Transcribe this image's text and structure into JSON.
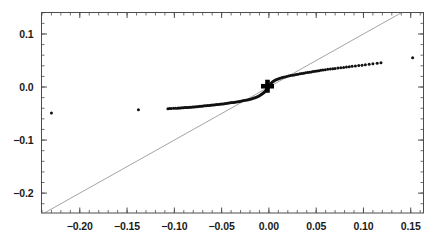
{
  "chart_data": {
    "type": "scatter",
    "title": "",
    "subtitle": "",
    "xlabel": "",
    "ylabel": "",
    "xlim": [
      -0.2405,
      0.1635
    ],
    "ylim": [
      -0.2375,
      0.1405
    ],
    "grid": false,
    "legend": null,
    "xticks": [
      -0.2,
      -0.15,
      -0.1,
      -0.05,
      0.0,
      0.05,
      0.1,
      0.15
    ],
    "xtick_labels": [
      "-0.20",
      "-0.15",
      "-0.10",
      "-0.05",
      "0.00",
      "0.05",
      "0.10",
      "0.15"
    ],
    "yticks": [
      0.1,
      0.0,
      -0.1,
      -0.2
    ],
    "ytick_labels": [
      "0.1",
      "0.0",
      "-0.1",
      "-0.2"
    ],
    "xminor_step": 0.01,
    "yminor_step": 0.02,
    "ticks_inward": true,
    "frame": true,
    "marker": "filled-circle",
    "marker_size": 3.0,
    "marker_color": "#111111",
    "reference_line": {
      "name": "identity-line",
      "type": "line",
      "slope": 1.0,
      "intercept": 0.0,
      "color": "#666666",
      "width": 0.6,
      "x_from": -0.2405,
      "x_to": 0.1405
    },
    "highlight_marker": {
      "name": "origin-plus-marker",
      "symbol": "plus",
      "x": -0.0015,
      "y": 0.0015,
      "size": 13,
      "thickness": 4.6,
      "color": "#000000"
    },
    "series": [
      {
        "name": "quantiles",
        "color": "#111111",
        "points": [
          [
            -0.23,
            -0.049
          ],
          [
            -0.138,
            -0.0428
          ],
          [
            -0.1068,
            -0.0408
          ],
          [
            -0.105,
            -0.0406
          ],
          [
            -0.1032,
            -0.0404
          ],
          [
            -0.1008,
            -0.0402
          ],
          [
            -0.0988,
            -0.04
          ],
          [
            -0.0968,
            -0.0398
          ],
          [
            -0.0952,
            -0.0396
          ],
          [
            -0.0936,
            -0.0394
          ],
          [
            -0.092,
            -0.0392
          ],
          [
            -0.0904,
            -0.039
          ],
          [
            -0.0888,
            -0.0388
          ],
          [
            -0.0872,
            -0.0386
          ],
          [
            -0.0856,
            -0.0384
          ],
          [
            -0.084,
            -0.0382
          ],
          [
            -0.0824,
            -0.038
          ],
          [
            -0.0808,
            -0.0378
          ],
          [
            -0.0792,
            -0.0376
          ],
          [
            -0.0776,
            -0.0373
          ],
          [
            -0.076,
            -0.037
          ],
          [
            -0.0744,
            -0.0367
          ],
          [
            -0.0728,
            -0.0364
          ],
          [
            -0.0712,
            -0.0361
          ],
          [
            -0.0696,
            -0.0358
          ],
          [
            -0.068,
            -0.0355
          ],
          [
            -0.0664,
            -0.0352
          ],
          [
            -0.0648,
            -0.0349
          ],
          [
            -0.0632,
            -0.0346
          ],
          [
            -0.0616,
            -0.0343
          ],
          [
            -0.06,
            -0.034
          ],
          [
            -0.0584,
            -0.0337
          ],
          [
            -0.0568,
            -0.0334
          ],
          [
            -0.0552,
            -0.0331
          ],
          [
            -0.0536,
            -0.0328
          ],
          [
            -0.052,
            -0.0325
          ],
          [
            -0.0504,
            -0.0322
          ],
          [
            -0.0488,
            -0.0318
          ],
          [
            -0.0472,
            -0.0314
          ],
          [
            -0.0456,
            -0.031
          ],
          [
            -0.044,
            -0.0306
          ],
          [
            -0.0424,
            -0.0302
          ],
          [
            -0.0408,
            -0.0298
          ],
          [
            -0.0392,
            -0.0294
          ],
          [
            -0.0376,
            -0.029
          ],
          [
            -0.036,
            -0.0286
          ],
          [
            -0.0344,
            -0.0281
          ],
          [
            -0.0328,
            -0.0276
          ],
          [
            -0.0312,
            -0.0271
          ],
          [
            -0.0296,
            -0.0266
          ],
          [
            -0.028,
            -0.0261
          ],
          [
            -0.0264,
            -0.0256
          ],
          [
            -0.0248,
            -0.025
          ],
          [
            -0.0232,
            -0.0244
          ],
          [
            -0.0216,
            -0.0238
          ],
          [
            -0.02,
            -0.0231
          ],
          [
            -0.0186,
            -0.0224
          ],
          [
            -0.0172,
            -0.0217
          ],
          [
            -0.0158,
            -0.0209
          ],
          [
            -0.0146,
            -0.0201
          ],
          [
            -0.0134,
            -0.0192
          ],
          [
            -0.0122,
            -0.0183
          ],
          [
            -0.011,
            -0.0173
          ],
          [
            -0.01,
            -0.0163
          ],
          [
            -0.009,
            -0.0152
          ],
          [
            -0.008,
            -0.0141
          ],
          [
            -0.007,
            -0.0129
          ],
          [
            -0.0062,
            -0.0117
          ],
          [
            -0.0054,
            -0.0105
          ],
          [
            -0.0046,
            -0.0092
          ],
          [
            -0.0038,
            -0.0078
          ],
          [
            -0.0031,
            -0.0064
          ],
          [
            -0.0025,
            -0.005
          ],
          [
            -0.0019,
            -0.0036
          ],
          [
            -0.0013,
            -0.0021
          ],
          [
            -0.0008,
            -0.0007
          ],
          [
            -0.0003,
            0.0007
          ],
          [
            0.0002,
            0.0021
          ],
          [
            0.0007,
            0.0035
          ],
          [
            0.0013,
            0.0049
          ],
          [
            0.0019,
            0.0063
          ],
          [
            0.0026,
            0.0077
          ],
          [
            0.0034,
            0.009
          ],
          [
            0.0043,
            0.0103
          ],
          [
            0.0053,
            0.0115
          ],
          [
            0.0064,
            0.0126
          ],
          [
            0.0076,
            0.0137
          ],
          [
            0.0089,
            0.0147
          ],
          [
            0.0103,
            0.0157
          ],
          [
            0.0118,
            0.0166
          ],
          [
            0.0134,
            0.0175
          ],
          [
            0.0151,
            0.0183
          ],
          [
            0.0169,
            0.0191
          ],
          [
            0.0188,
            0.0199
          ],
          [
            0.0208,
            0.0207
          ],
          [
            0.0228,
            0.0215
          ],
          [
            0.0248,
            0.0222
          ],
          [
            0.0268,
            0.0229
          ],
          [
            0.0288,
            0.0236
          ],
          [
            0.0308,
            0.0243
          ],
          [
            0.0328,
            0.0249
          ],
          [
            0.0348,
            0.0255
          ],
          [
            0.0368,
            0.0261
          ],
          [
            0.0388,
            0.0267
          ],
          [
            0.0408,
            0.0273
          ],
          [
            0.0428,
            0.0279
          ],
          [
            0.0448,
            0.0285
          ],
          [
            0.0468,
            0.0291
          ],
          [
            0.0488,
            0.0297
          ],
          [
            0.0508,
            0.0303
          ],
          [
            0.0528,
            0.0309
          ],
          [
            0.0548,
            0.0315
          ],
          [
            0.057,
            0.0321
          ],
          [
            0.0596,
            0.0327
          ],
          [
            0.0622,
            0.0333
          ],
          [
            0.065,
            0.0339
          ],
          [
            0.0676,
            0.0345
          ],
          [
            0.07,
            0.0351
          ],
          [
            0.073,
            0.0358
          ],
          [
            0.076,
            0.0364
          ],
          [
            0.079,
            0.037
          ],
          [
            0.082,
            0.0377
          ],
          [
            0.085,
            0.0383
          ],
          [
            0.088,
            0.039
          ],
          [
            0.0915,
            0.0397
          ],
          [
            0.095,
            0.0404
          ],
          [
            0.0985,
            0.0411
          ],
          [
            0.102,
            0.0419
          ],
          [
            0.106,
            0.0428
          ],
          [
            0.11,
            0.0437
          ],
          [
            0.1145,
            0.0447
          ],
          [
            0.1185,
            0.0456
          ],
          [
            0.152,
            0.055
          ]
        ]
      }
    ],
    "notable_points": [
      {
        "name": "left-outlier-far",
        "x": -0.23,
        "y": -0.049
      },
      {
        "name": "left-outlier-near",
        "x": -0.138,
        "y": -0.0428
      },
      {
        "name": "right-outlier",
        "x": 0.152,
        "y": 0.055
      },
      {
        "name": "origin-marker",
        "x": 0.0,
        "y": 0.0
      }
    ]
  },
  "axes": {
    "x_tick_labels": [
      "-0.20",
      "-0.15",
      "-0.10",
      "-0.05",
      "0.00",
      "0.05",
      "0.10",
      "0.15"
    ],
    "y_tick_labels": [
      "0.1",
      "0.0",
      "-0.1",
      "-0.2"
    ]
  }
}
